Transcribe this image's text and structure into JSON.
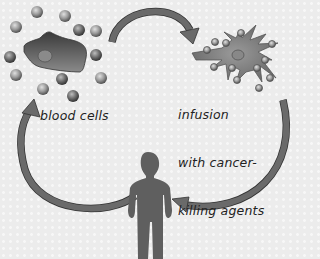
{
  "diagram": {
    "labels": {
      "blood_cells": "blood cells",
      "infusion_line1": "infusion",
      "infusion_line2": "with cancer-",
      "infusion_line3": "killing agents"
    },
    "nodes": [
      {
        "id": "blood-cells",
        "label": "blood cells",
        "icon": "tumor-cell-with-blood-cells"
      },
      {
        "id": "activated-cell",
        "label": "infusion with cancer-killing agents",
        "icon": "activated-immune-cell"
      },
      {
        "id": "patient",
        "label": "",
        "icon": "human-silhouette"
      }
    ],
    "edges": [
      {
        "from": "blood-cells",
        "to": "activated-cell"
      },
      {
        "from": "activated-cell",
        "to": "patient"
      },
      {
        "from": "patient",
        "to": "blood-cells"
      }
    ],
    "colors": {
      "arrow": "#6a6a6a",
      "figure": "#5f5f5f",
      "background": "#ececec",
      "text": "#222222"
    }
  }
}
